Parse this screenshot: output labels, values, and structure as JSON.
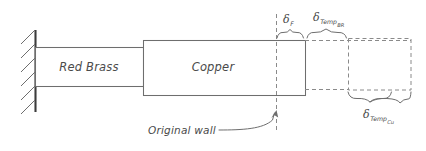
{
  "figure": {
    "kind": "engineering-deformation-diagram",
    "background_color": "#ffffff",
    "line_color": "#6e6e6e",
    "wall_color": "#3c3c3c",
    "dashed_color": "#8a8a8a",
    "text_color": "#4a4a4a"
  },
  "blocks": {
    "red_brass": {
      "label": "Red Brass",
      "x": 35,
      "y": 47,
      "width": 108,
      "height": 39
    },
    "copper": {
      "label": "Copper",
      "x": 143,
      "y": 40,
      "width": 162,
      "height": 55
    }
  },
  "wall": {
    "name": "fixed-support-wall",
    "x": 35,
    "y_top": 30,
    "y_bottom": 112,
    "hatch_count": 6
  },
  "original_wall_marker": {
    "label": "Original wall",
    "line_x": 276,
    "line_y_top": 14,
    "line_y_bottom": 130,
    "text_x": 148,
    "text_y": 134
  },
  "ghost_block": {
    "name": "copper-thermal-expansion-ghost",
    "x": 348,
    "y": 38,
    "width": 63,
    "height": 52
  },
  "dimensions": [
    {
      "id": "delta-f",
      "symbol": "δ",
      "sub": "F",
      "sub2": "",
      "brace_x1": 276,
      "brace_x2": 305,
      "brace_y": 34,
      "direction": "up",
      "label_x": 287,
      "label_y": 22
    },
    {
      "id": "delta-temp-br",
      "symbol": "δ",
      "sub": "Temp",
      "sub2": "BR",
      "brace_x1": 307,
      "brace_x2": 348,
      "brace_y": 34,
      "direction": "up",
      "label_x": 319,
      "label_y": 20
    },
    {
      "id": "delta-temp-cu",
      "symbol": "δ",
      "sub": "Temp",
      "sub2": "Cu",
      "brace_x1": 348,
      "brace_x2": 411,
      "brace_y": 92,
      "direction": "down",
      "label_x": 363,
      "label_y": 118
    }
  ]
}
